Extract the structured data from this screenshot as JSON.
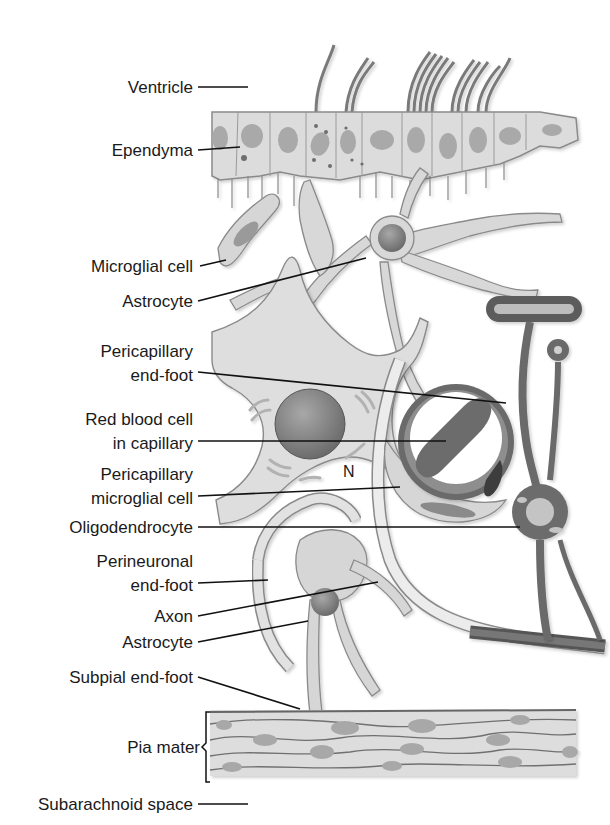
{
  "figure": {
    "nucleus_marker": "N"
  },
  "labels": [
    {
      "id": "ventricle",
      "lines": [
        "Ventricle"
      ]
    },
    {
      "id": "ependyma",
      "lines": [
        "Ependyma"
      ]
    },
    {
      "id": "microglial-cell",
      "lines": [
        "Microglial cell"
      ]
    },
    {
      "id": "astrocyte-upper",
      "lines": [
        "Astrocyte"
      ]
    },
    {
      "id": "pericapillary-end-foot",
      "lines": [
        "Pericapillary",
        "end-foot"
      ]
    },
    {
      "id": "red-blood-cell",
      "lines": [
        "Red blood cell",
        "in capillary"
      ]
    },
    {
      "id": "pericapillary-microglial-cell",
      "lines": [
        "Pericapillary",
        "microglial cell"
      ]
    },
    {
      "id": "oligodendrocyte",
      "lines": [
        "Oligodendrocyte"
      ]
    },
    {
      "id": "perineuronal-end-foot",
      "lines": [
        "Perineuronal",
        "end-foot"
      ]
    },
    {
      "id": "axon",
      "lines": [
        "Axon"
      ]
    },
    {
      "id": "astrocyte-lower",
      "lines": [
        "Astrocyte"
      ]
    },
    {
      "id": "subpial-end-foot",
      "lines": [
        "Subpial end-foot"
      ]
    },
    {
      "id": "pia-mater",
      "lines": [
        "Pia mater"
      ]
    },
    {
      "id": "subarachnoid-space",
      "lines": [
        "Subarachnoid space"
      ]
    }
  ],
  "colors": {
    "cell_fill": "#d9d9d9",
    "cell_stroke": "#8a8a8a",
    "nucleus": "#8c8c8c",
    "dark_structure": "#5e5e5e",
    "leader_line": "#111111",
    "text": "#1a1a1a"
  }
}
